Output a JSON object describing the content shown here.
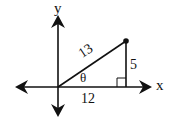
{
  "diagram": {
    "type": "right-triangle-on-axes",
    "axes": {
      "x_label": "x",
      "y_label": "y"
    },
    "triangle": {
      "hypotenuse_label": "13",
      "opposite_label": "5",
      "adjacent_label": "12",
      "angle_label": "θ",
      "right_angle_marker": true,
      "terminal_point_marker": "filled-dot"
    },
    "colors": {
      "stroke": "#111111",
      "background": "#ffffff"
    }
  }
}
